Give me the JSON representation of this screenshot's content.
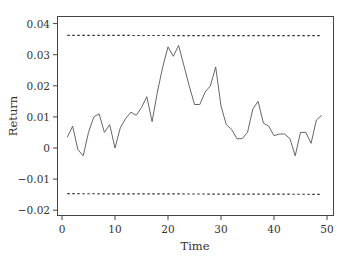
{
  "chart_data": {
    "type": "line",
    "title": "",
    "xlabel": "Time",
    "ylabel": "Return",
    "xlim": [
      0,
      50
    ],
    "ylim": [
      -0.022,
      0.042
    ],
    "xticks": [
      0,
      10,
      20,
      30,
      40,
      50
    ],
    "xtick_labels": [
      "0",
      "10",
      "20",
      "30",
      "40",
      "50"
    ],
    "yticks": [
      -0.02,
      -0.01,
      0,
      0.01,
      0.02,
      0.03,
      0.04
    ],
    "ytick_labels": [
      "-0.02",
      "-0.01",
      "0",
      "0.01",
      "0.02",
      "0.03",
      "0.04"
    ],
    "grid": false,
    "legend": null,
    "series": [
      {
        "name": "Return",
        "style": "solid",
        "color": "#555555",
        "x": [
          1,
          2,
          3,
          4,
          5,
          6,
          7,
          8,
          9,
          10,
          11,
          12,
          13,
          14,
          15,
          16,
          17,
          18,
          19,
          20,
          21,
          22,
          23,
          24,
          25,
          26,
          27,
          28,
          29,
          30,
          31,
          32,
          33,
          34,
          35,
          36,
          37,
          38,
          39,
          40,
          41,
          42,
          43,
          44,
          45,
          46,
          47,
          48,
          49
        ],
        "values": [
          0.0035,
          0.007,
          -0.0005,
          -0.0025,
          0.005,
          0.01,
          0.011,
          0.005,
          0.0075,
          0.0,
          0.0065,
          0.0095,
          0.0115,
          0.0105,
          0.013,
          0.0165,
          0.0085,
          0.018,
          0.026,
          0.0325,
          0.0295,
          0.033,
          0.0265,
          0.02,
          0.014,
          0.014,
          0.018,
          0.02,
          0.026,
          0.0135,
          0.0075,
          0.006,
          0.003,
          0.003,
          0.005,
          0.0125,
          0.015,
          0.008,
          0.007,
          0.004,
          0.0045,
          0.0045,
          0.003,
          -0.0025,
          0.005,
          0.005,
          0.0015,
          0.009,
          0.0105
        ]
      },
      {
        "name": "Upper limit",
        "style": "dashed",
        "color": "#333333",
        "x": [
          1,
          49
        ],
        "values": [
          0.0362,
          0.0361
        ]
      },
      {
        "name": "Lower limit",
        "style": "dashed",
        "color": "#333333",
        "x": [
          1,
          49
        ],
        "values": [
          -0.0147,
          -0.0149
        ]
      }
    ]
  }
}
